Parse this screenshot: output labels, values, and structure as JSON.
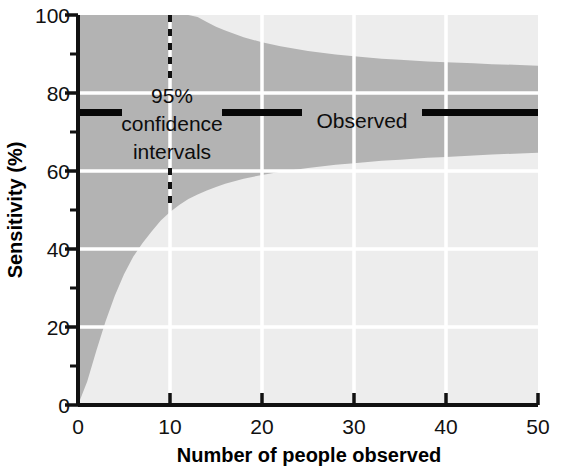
{
  "chart_data": {
    "type": "area",
    "title": "",
    "xlabel": "Number of people observed",
    "ylabel": "Sensitivity (%)",
    "xlim": [
      0,
      50
    ],
    "ylim": [
      0,
      100
    ],
    "x_ticks": [
      0,
      10,
      20,
      30,
      40,
      50
    ],
    "x_tick_labels": [
      "0",
      "10",
      "20",
      "30",
      "40",
      "50"
    ],
    "x_minor_ticks": [
      5,
      15,
      25,
      35,
      45
    ],
    "y_ticks": [
      0,
      20,
      40,
      60,
      80,
      100
    ],
    "y_tick_labels": [
      "0",
      "20",
      "40",
      "60",
      "80",
      "100"
    ],
    "y_minor_ticks": [
      10,
      30,
      50,
      70,
      90
    ],
    "grid": true,
    "grid_color": "#ffffff",
    "plot_background": "#ededed",
    "band_color": "#b3b3b3",
    "legend_position": "inline-annotations",
    "observed_value": 75,
    "observed_label": "Observed",
    "ci_label_lines": [
      "95%",
      "confidence",
      "intervals"
    ],
    "ci_marker_x": 10,
    "ci_marker_low": 50,
    "ci_marker_high": 100,
    "series": [
      {
        "name": "95% confidence interval upper bound",
        "x": [
          0,
          1,
          2,
          3,
          4,
          5,
          6,
          7,
          8,
          9,
          10,
          11,
          12,
          13,
          14,
          15,
          16,
          18,
          20,
          22,
          25,
          28,
          30,
          33,
          35,
          38,
          40,
          43,
          45,
          48,
          50
        ],
        "values": [
          100,
          100,
          100,
          100,
          100,
          100,
          100,
          100,
          100,
          100,
          100,
          100,
          100,
          99.5,
          98.2,
          97.0,
          96.0,
          94.3,
          93.0,
          92.0,
          90.8,
          89.9,
          89.4,
          88.8,
          88.5,
          88.1,
          87.9,
          87.6,
          87.4,
          87.2,
          87.0
        ]
      },
      {
        "name": "95% confidence interval lower bound",
        "x": [
          0,
          1,
          2,
          3,
          4,
          5,
          6,
          7,
          8,
          9,
          10,
          11,
          12,
          13,
          14,
          15,
          16,
          18,
          20,
          22,
          25,
          28,
          30,
          33,
          35,
          38,
          40,
          43,
          45,
          48,
          50
        ],
        "values": [
          0,
          6.0,
          14.0,
          21.5,
          28.0,
          33.5,
          38.0,
          41.5,
          44.5,
          47.3,
          49.5,
          51.3,
          52.8,
          54.0,
          55.0,
          55.9,
          56.7,
          58.0,
          59.0,
          59.8,
          60.8,
          61.6,
          62.0,
          62.6,
          62.9,
          63.4,
          63.6,
          64.0,
          64.2,
          64.5,
          64.7
        ]
      },
      {
        "name": "Observed sensitivity",
        "x": [
          0,
          50
        ],
        "values": [
          75,
          75
        ]
      }
    ]
  },
  "axes": {
    "x_title": "Number of people observed",
    "y_title": "Sensitivity (%)"
  },
  "annotations": {
    "ci_line1": "95%",
    "ci_line2": "confidence",
    "ci_line3": "intervals",
    "observed": "Observed"
  },
  "x_tick_labels": {
    "t0": "0",
    "t1": "10",
    "t2": "20",
    "t3": "30",
    "t4": "40",
    "t5": "50"
  },
  "y_tick_labels": {
    "t0": "0",
    "t1": "20",
    "t2": "40",
    "t3": "60",
    "t4": "80",
    "t5": "100"
  },
  "colors": {
    "band": "#b3b3b3",
    "plot_bg": "#ededed",
    "grid": "#ffffff",
    "axis": "#111111",
    "text": "#0d0d0d"
  }
}
